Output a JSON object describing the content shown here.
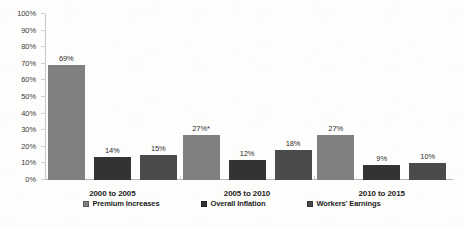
{
  "chart_data": {
    "type": "bar",
    "title": "",
    "subtitle": "",
    "xlabel": "",
    "ylabel": "",
    "ylim": [
      0,
      100
    ],
    "ytick_labels": [
      "100%",
      "90%",
      "80%",
      "70%",
      "60%",
      "50%",
      "40%",
      "30%",
      "20%",
      "10%",
      "0%"
    ],
    "ytick_values": [
      100,
      90,
      80,
      70,
      60,
      50,
      40,
      30,
      20,
      10,
      0
    ],
    "grid": false,
    "legend_position": "bottom",
    "categories": [
      "2000 to 2005",
      "2005 to 2010",
      "2010 to 2015"
    ],
    "series": [
      {
        "name": "Premium Increases",
        "color": "#808080",
        "values": [
          69,
          27,
          27
        ],
        "labels": [
          "69%",
          "27%*",
          "27%"
        ]
      },
      {
        "name": "Overall Inflation",
        "color": "#333333",
        "values": [
          14,
          12,
          9
        ],
        "labels": [
          "14%",
          "12%",
          "9%"
        ]
      },
      {
        "name": "Workers' Earnings",
        "color": "#4a4a4a",
        "values": [
          15,
          18,
          10
        ],
        "labels": [
          "15%",
          "18%",
          "10%"
        ]
      }
    ],
    "annotations": [
      "*"
    ]
  },
  "legend": {
    "items": [
      {
        "label": "Premium Increases",
        "color": "#808080"
      },
      {
        "label": "Overall Inflation",
        "color": "#333333"
      },
      {
        "label": "Workers' Earnings",
        "color": "#4a4a4a"
      }
    ]
  }
}
